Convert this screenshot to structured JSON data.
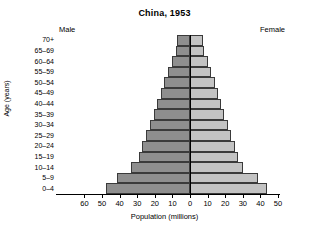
{
  "chart_data": {
    "type": "bar",
    "subtype": "population-pyramid",
    "title": "China, 1953",
    "xlabel": "Population (millions)",
    "ylabel": "Age (years)",
    "left_label": "Male",
    "right_label": "Female",
    "categories": [
      "70+",
      "65–69",
      "60–64",
      "55–59",
      "50–54",
      "45–49",
      "40–44",
      "35–39",
      "30–34",
      "25–29",
      "20–24",
      "15–19",
      "10–14",
      "5–9",
      "0–4"
    ],
    "series": [
      {
        "name": "Male",
        "side": "left",
        "color": "#8e8e8e",
        "values": [
          7.5,
          8.0,
          10.5,
          12.5,
          14.5,
          16.5,
          18.5,
          20.5,
          22.5,
          25.0,
          27.0,
          29.0,
          33.5,
          41.5,
          47.5
        ]
      },
      {
        "name": "Female",
        "side": "right",
        "color": "#c3c3c3",
        "values": [
          7.5,
          8.0,
          10.0,
          12.0,
          14.0,
          16.0,
          17.5,
          19.5,
          21.5,
          23.5,
          25.5,
          27.5,
          30.0,
          38.5,
          44.0
        ]
      }
    ],
    "x_ticks_left": [
      60,
      50,
      40,
      30,
      20,
      10
    ],
    "x_ticks_right": [
      0,
      10,
      20,
      30,
      40,
      50
    ],
    "x_tick_labels": [
      "60",
      "50",
      "40",
      "30",
      "20",
      "10",
      "0",
      "10",
      "20",
      "30",
      "40",
      "50"
    ],
    "xlim_left": 60,
    "xlim_right": 50,
    "grid": false,
    "legend": "inline-side-labels"
  }
}
